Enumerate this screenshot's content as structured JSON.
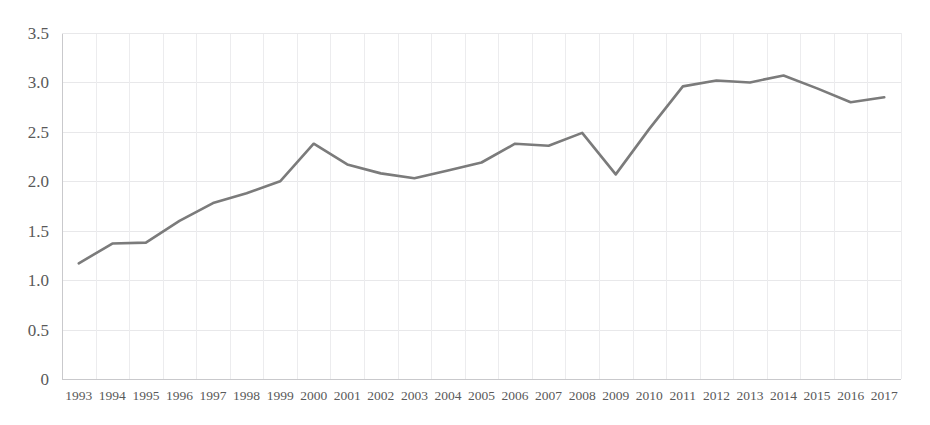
{
  "chart_data": {
    "type": "line",
    "title": "",
    "subtitle": "",
    "xlabel": "",
    "ylabel": "",
    "categories": [
      "1993",
      "1994",
      "1995",
      "1996",
      "1997",
      "1998",
      "1999",
      "2000",
      "2001",
      "2002",
      "2003",
      "2004",
      "2005",
      "2006",
      "2007",
      "2008",
      "2009",
      "2010",
      "2011",
      "2012",
      "2013",
      "2014",
      "2015",
      "2016",
      "2017"
    ],
    "values": [
      1.17,
      1.37,
      1.38,
      1.6,
      1.78,
      1.88,
      2.0,
      2.38,
      2.17,
      2.08,
      2.03,
      2.11,
      2.19,
      2.38,
      2.36,
      2.49,
      2.07,
      2.53,
      2.96,
      3.02,
      3.0,
      3.07,
      2.94,
      2.8,
      2.85
    ],
    "series": [
      {
        "name": "series-1",
        "color": "#7b7b7b",
        "values": [
          1.17,
          1.37,
          1.38,
          1.6,
          1.78,
          1.88,
          2.0,
          2.38,
          2.17,
          2.08,
          2.03,
          2.11,
          2.19,
          2.38,
          2.36,
          2.49,
          2.07,
          2.53,
          2.96,
          3.02,
          3.0,
          3.07,
          2.94,
          2.8,
          2.85
        ]
      }
    ],
    "ylim": [
      0,
      3.5
    ],
    "yticks": [
      0,
      0.5,
      1.0,
      1.5,
      2.0,
      2.5,
      3.0,
      3.5
    ],
    "ytick_labels": [
      "0",
      "0.5",
      "1.0",
      "1.5",
      "2.0",
      "2.5",
      "3.0",
      "3.5"
    ],
    "xtick_labels": [
      "1993",
      "1994",
      "1995",
      "1996",
      "1997",
      "1998",
      "1999",
      "2000",
      "2001",
      "2002",
      "2003",
      "2004",
      "2005",
      "2006",
      "2007",
      "2008",
      "2009",
      "2010",
      "2011",
      "2012",
      "2013",
      "2014",
      "2015",
      "2016",
      "2017"
    ],
    "grid": {
      "horizontal": true,
      "vertical": true
    },
    "legend": {
      "visible": false,
      "position": "none"
    },
    "annotations": []
  },
  "style": {
    "line_color": "#7b7b7b",
    "grid_color": "#e8e8ea",
    "axis_color": "#c9c9cc",
    "tick_text_color": "#595959",
    "background": "#ffffff"
  },
  "layout": {
    "plot_left": 62,
    "plot_right": 901,
    "plot_top": 33,
    "plot_bottom": 379
  }
}
